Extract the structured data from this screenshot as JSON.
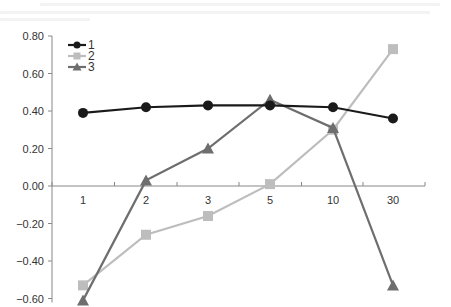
{
  "chart_data": {
    "type": "line",
    "title": "",
    "xlabel": "",
    "ylabel": "",
    "categories": [
      "1",
      "2",
      "3",
      "5",
      "10",
      "30"
    ],
    "ylim": [
      -0.6,
      0.8
    ],
    "yticks": [
      "0.80",
      "0.60",
      "0.40",
      "0.20",
      "0.00",
      "−0.20",
      "−0.40",
      "−0.60"
    ],
    "ytick_values": [
      0.8,
      0.6,
      0.4,
      0.2,
      0.0,
      -0.2,
      -0.4,
      -0.6
    ],
    "grid": false,
    "legend_position": "upper-left",
    "series": [
      {
        "name": "1",
        "color": "#1a1a1a",
        "marker": "circle",
        "values": [
          0.39,
          0.42,
          0.43,
          0.43,
          0.42,
          0.36
        ]
      },
      {
        "name": "2",
        "color": "#bdbdbd",
        "marker": "square",
        "values": [
          -0.53,
          -0.26,
          -0.16,
          0.01,
          0.3,
          0.73
        ]
      },
      {
        "name": "3",
        "color": "#6e6e6e",
        "marker": "triangle",
        "values": [
          -0.61,
          0.03,
          0.2,
          0.46,
          0.31,
          -0.53
        ]
      }
    ]
  }
}
